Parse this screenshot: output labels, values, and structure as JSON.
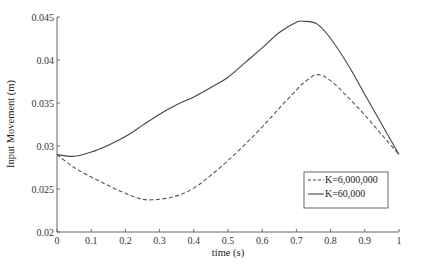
{
  "chart_data": {
    "type": "line",
    "title": "",
    "xlabel": "time (s)",
    "ylabel": "Input Movement (m)",
    "xlim": [
      0,
      1
    ],
    "ylim": [
      0.02,
      0.045
    ],
    "grid": false,
    "legend_position": "lower right",
    "xticks": [
      0,
      0.1,
      0.2,
      0.3,
      0.4,
      0.5,
      0.6,
      0.7,
      0.8,
      0.9,
      1
    ],
    "xtick_labels": [
      "0",
      "0.1",
      "0.2",
      "0.3",
      "0.4",
      "0.5",
      "0.6",
      "0.7",
      "0.8",
      "0.9",
      "1"
    ],
    "yticks": [
      0.02,
      0.025,
      0.03,
      0.035,
      0.04,
      0.045
    ],
    "ytick_labels": [
      "0.02",
      "0.025",
      "0.03",
      "0.035",
      "0.04",
      "0.045"
    ],
    "x": [
      0,
      0.05,
      0.1,
      0.15,
      0.2,
      0.25,
      0.3,
      0.35,
      0.4,
      0.45,
      0.5,
      0.55,
      0.6,
      0.65,
      0.7,
      0.72,
      0.76,
      0.8,
      0.85,
      0.9,
      0.95,
      1
    ],
    "series": [
      {
        "name": "K=6,000,000",
        "style": "dashed",
        "color": "#555555",
        "values": [
          0.029,
          0.0275,
          0.0264,
          0.0254,
          0.0245,
          0.0238,
          0.0238,
          0.0242,
          0.0251,
          0.0266,
          0.0283,
          0.0302,
          0.0322,
          0.0344,
          0.0365,
          0.0373,
          0.0383,
          0.0376,
          0.0357,
          0.0336,
          0.0313,
          0.029
        ]
      },
      {
        "name": "K=60,000",
        "style": "solid",
        "color": "#444444",
        "values": [
          0.029,
          0.0288,
          0.0293,
          0.0301,
          0.0311,
          0.0324,
          0.0337,
          0.0348,
          0.0357,
          0.0368,
          0.038,
          0.0397,
          0.0414,
          0.0432,
          0.0444,
          0.0445,
          0.0442,
          0.0425,
          0.0395,
          0.036,
          0.0325,
          0.029
        ]
      }
    ],
    "legend": [
      {
        "label": "K=6,000,000",
        "style": "dashed"
      },
      {
        "label": "K=60,000",
        "style": "solid"
      }
    ]
  }
}
